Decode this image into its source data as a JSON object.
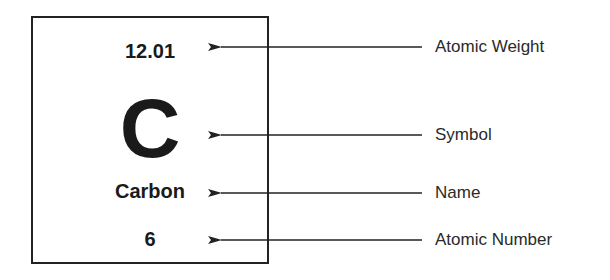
{
  "element_tile": {
    "atomic_weight": "12.01",
    "symbol": "C",
    "name": "Carbon",
    "atomic_number": "6"
  },
  "labels": [
    {
      "text": "Atomic Weight",
      "y": 47
    },
    {
      "text": "Symbol",
      "y": 135
    },
    {
      "text": "Name",
      "y": 193
    },
    {
      "text": "Atomic Number",
      "y": 240
    }
  ],
  "colors": {
    "stroke": "#222222",
    "text": "#1a1a1a"
  }
}
